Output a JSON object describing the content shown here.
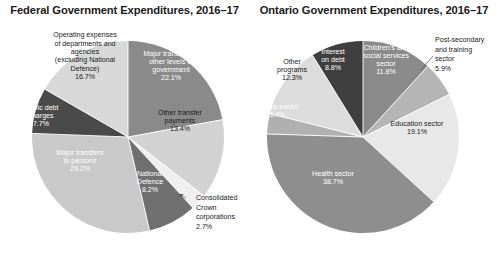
{
  "figure": {
    "background": "#ffffff",
    "label_dark_color": "#1a1a1a",
    "label_light_color": "#ffffff"
  },
  "chart_data": [
    {
      "type": "pie",
      "id": "federal",
      "title": "Federal Government Expenditures, 2016–17",
      "units": "percent",
      "total": 100.0,
      "start_angle_deg": 0,
      "direction": "clockwise",
      "legend": "none",
      "labels_inside": true,
      "categories": [
        "Major transfers to other levels of government",
        "Other transfer payments",
        "Consolidated Crown corporations",
        "National Defence",
        "Major transfers to persons",
        "Public debt charges",
        "Operating expenses of departments and agencies (excluding National Defence)"
      ],
      "values": [
        22.1,
        13.4,
        2.7,
        8.2,
        29.2,
        7.7,
        16.7
      ],
      "slices": [
        {
          "name": "Major transfers to other levels of government",
          "value": 22.1,
          "value_text": "22.1%",
          "color": "#8a8a8a",
          "label_lines": [
            "Major transfers to",
            "other levels of",
            "government",
            "22.1%"
          ],
          "label_placement": "inside",
          "label_color": "light"
        },
        {
          "name": "Other transfer payments",
          "value": 13.4,
          "value_text": "13.4%",
          "color": "#d2d2d2",
          "label_lines": [
            "Other transfer",
            "payments",
            "13.4%"
          ],
          "label_placement": "inside",
          "label_color": "dark"
        },
        {
          "name": "Consolidated Crown corporations",
          "value": 2.7,
          "value_text": "2.7%",
          "color": "#efefef",
          "label_lines": [
            "Consolidated",
            "Crown",
            "corporations",
            "2.7%"
          ],
          "label_placement": "callout",
          "label_color": "dark"
        },
        {
          "name": "National Defence",
          "value": 8.2,
          "value_text": "8.2%",
          "color": "#707070",
          "label_lines": [
            "National",
            "Defence",
            "8.2%"
          ],
          "label_placement": "inside",
          "label_color": "light"
        },
        {
          "name": "Major transfers to persons",
          "value": 29.2,
          "value_text": "29.2%",
          "color": "#c9c9c9",
          "label_lines": [
            "Major transfers",
            "to persons",
            "29.2%"
          ],
          "label_placement": "inside",
          "label_color": "light"
        },
        {
          "name": "Public debt charges",
          "value": 7.7,
          "value_text": "7.7%",
          "color": "#4a4a4a",
          "label_lines": [
            "Public debt",
            "charges",
            "7.7%"
          ],
          "label_placement": "inside",
          "label_color": "light"
        },
        {
          "name": "Operating expenses of departments and agencies (excluding National Defence)",
          "value": 16.7,
          "value_text": "16.7%",
          "color": "#d8d8d8",
          "label_lines": [
            "Operating expenses",
            "of  departments and",
            "agencies",
            "(excluding National",
            "Defence)",
            "16.7%"
          ],
          "label_placement": "inside",
          "label_color": "dark"
        }
      ]
    },
    {
      "type": "pie",
      "id": "ontario",
      "title": "Ontario Government Expenditures, 2016–17",
      "units": "percent",
      "total": 100.0,
      "start_angle_deg": 0,
      "direction": "clockwise",
      "legend": "none",
      "labels_inside": true,
      "categories": [
        "Children's and social services sector",
        "Post-secondary and training sector",
        "Education sector",
        "Health sector",
        "Justice sector",
        "Other programs",
        "Interest on debt"
      ],
      "values": [
        11.8,
        5.9,
        19.1,
        38.7,
        3.4,
        12.3,
        8.8
      ],
      "slices": [
        {
          "name": "Children's and social services sector",
          "value": 11.8,
          "value_text": "11.8%",
          "color": "#8a8a8a",
          "label_lines": [
            "Children’s and",
            "social services",
            "sector",
            "11.8%"
          ],
          "label_placement": "inside",
          "label_color": "light"
        },
        {
          "name": "Post-secondary and training sector",
          "value": 5.9,
          "value_text": "5.9%",
          "color": "#b5b5b5",
          "label_lines": [
            "Post-secondary",
            "and training",
            "sector",
            "5.9%"
          ],
          "label_placement": "callout",
          "label_color": "dark"
        },
        {
          "name": "Education sector",
          "value": 19.1,
          "value_text": "19.1%",
          "color": "#e8e8e8",
          "label_lines": [
            "Education sector",
            "19.1%"
          ],
          "label_placement": "inside",
          "label_color": "dark"
        },
        {
          "name": "Health sector",
          "value": 38.7,
          "value_text": "38.7%",
          "color": "#8e8e8e",
          "label_lines": [
            "Health sector",
            "38.7%"
          ],
          "label_placement": "inside",
          "label_color": "light"
        },
        {
          "name": "Justice sector",
          "value": 3.4,
          "value_text": "3.4%",
          "color": "#b0b0b0",
          "label_lines": [
            "Justice sector",
            "3.4%"
          ],
          "label_placement": "inside",
          "label_color": "light"
        },
        {
          "name": "Other programs",
          "value": 12.3,
          "value_text": "12.3%",
          "color": "#dcdcdc",
          "label_lines": [
            "Other",
            "programs",
            "12.3%"
          ],
          "label_placement": "inside",
          "label_color": "dark"
        },
        {
          "name": "Interest on debt",
          "value": 8.8,
          "value_text": "8.8%",
          "color": "#3f3f3f",
          "label_lines": [
            "Interest",
            "on debt",
            "8.8%"
          ],
          "label_placement": "inside",
          "label_color": "light"
        }
      ]
    }
  ]
}
